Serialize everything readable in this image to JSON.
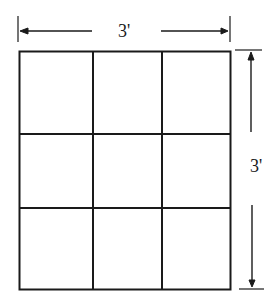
{
  "diagram": {
    "grid": {
      "rows": 3,
      "columns": 3
    },
    "dimensions": {
      "width_label": "3'",
      "height_label": "3'"
    },
    "colors": {
      "line": "#1a1a1a",
      "background": "#ffffff"
    }
  }
}
